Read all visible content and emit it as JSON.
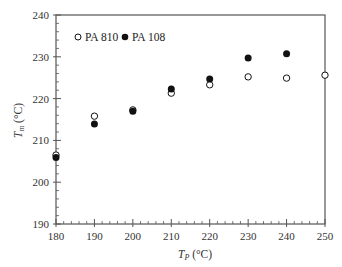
{
  "chart_data": {
    "type": "scatter",
    "title": "",
    "xlabel": "T_P (°C)",
    "xlabel_main": "T",
    "xlabel_sub": "P",
    "xlabel_unit": " (°C)",
    "ylabel": "T_m (°C)",
    "ylabel_main": "T",
    "ylabel_sub": "m",
    "ylabel_unit": " (°C)",
    "xlim": [
      180,
      250
    ],
    "ylim": [
      190,
      240
    ],
    "xticks": [
      180,
      190,
      200,
      210,
      220,
      230,
      240,
      250
    ],
    "yticks": [
      190,
      200,
      210,
      220,
      230,
      240
    ],
    "x_minor_per_major": 5,
    "y_minor_per_major": 5,
    "grid": false,
    "legend_position": "upper left",
    "series": [
      {
        "name": "PA 810",
        "marker": "open-circle",
        "x": [
          180,
          190,
          200,
          210,
          220,
          230,
          240,
          250
        ],
        "y": [
          206.5,
          215.8,
          217.3,
          221.3,
          223.3,
          225.2,
          224.9,
          225.6
        ]
      },
      {
        "name": "PA 108",
        "marker": "filled-circle",
        "x": [
          180,
          190,
          200,
          210,
          220,
          230,
          240
        ],
        "y": [
          205.9,
          213.9,
          217.0,
          222.3,
          224.7,
          229.7,
          230.7
        ]
      }
    ]
  },
  "legend": {
    "items": [
      {
        "label": "PA 810",
        "marker": "open-circle"
      },
      {
        "label": "PA 108",
        "marker": "filled-circle"
      }
    ]
  },
  "colors": {
    "axis": "#555555",
    "marker": "#111111",
    "background": "#ffffff"
  }
}
